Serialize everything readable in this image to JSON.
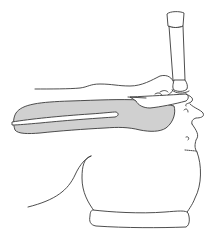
{
  "illustration": {
    "subject": "laryngoscope inserted in patient airway, side view",
    "colors": {
      "background": "#ffffff",
      "line": "#3a3a3a",
      "airway_fill": "#d0d0d0"
    },
    "parts": [
      "laryngoscope-handle",
      "laryngoscope-blade",
      "tongue-outline",
      "airway-shading",
      "head-profile",
      "neck-and-shoulder",
      "head-pillow"
    ]
  }
}
